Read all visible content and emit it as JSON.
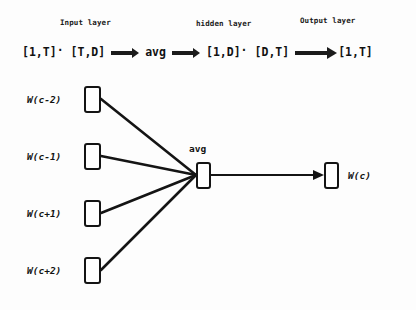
{
  "diagram": {
    "background_color": "#fdfdfd",
    "stroke_color": "#141414"
  },
  "layer_captions": {
    "input": "Input layer",
    "hidden": "hidden layer",
    "output": "Output layer"
  },
  "formula": {
    "tokens": [
      "[1,T]",
      "[T,D]",
      "avg",
      "[1,D]",
      "[D,T]",
      "[1,T]"
    ],
    "dot_operator": "·",
    "arrow_glyph": "⟹",
    "full_text": "[1,T]· [T,D] ⟹ avg ⟹ [1,D]· [D,T] ⟹ [1,T]"
  },
  "input_nodes": [
    {
      "label": "W(c-2)",
      "x": 84,
      "y": 86
    },
    {
      "label": "W(c-1)",
      "x": 84,
      "y": 143
    },
    {
      "label": "W(c+1)",
      "x": 84,
      "y": 200
    },
    {
      "label": "W(c+2)",
      "x": 84,
      "y": 257
    }
  ],
  "hidden_node": {
    "caption": "avg",
    "x": 196,
    "y": 163
  },
  "output_node": {
    "label": "W(c)",
    "x": 325,
    "y": 163
  },
  "edges": {
    "count": 5,
    "description": "four input nodes converge on the avg hidden node; one arrow from hidden node to output node"
  }
}
